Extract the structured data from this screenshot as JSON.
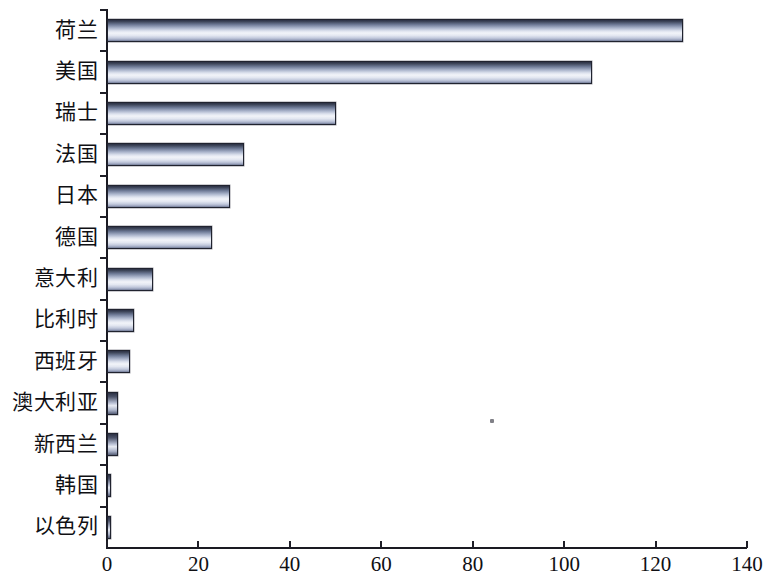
{
  "chart_data": {
    "type": "bar",
    "orientation": "horizontal",
    "title": "",
    "subtitle": "",
    "xlabel": "",
    "ylabel": "",
    "xlim": [
      0,
      140
    ],
    "xticks": [
      0,
      20,
      40,
      60,
      80,
      100,
      120,
      140
    ],
    "xtick_labels": [
      "0",
      "20",
      "40",
      "60",
      "80",
      "100",
      "120",
      "140"
    ],
    "grid": false,
    "legend": false,
    "legend_position": "none",
    "categories": [
      "荷兰",
      "美国",
      "瑞士",
      "法国",
      "日本",
      "德国",
      "意大利",
      "比利时",
      "西班牙",
      "澳大利亚",
      "新西兰",
      "韩国",
      "以色列"
    ],
    "values": [
      126,
      106,
      50,
      30,
      27,
      23,
      10,
      6,
      5,
      2.4,
      2.4,
      0.9,
      0.8
    ],
    "bar_style": {
      "fill": "vertical-gradient-steel-blue",
      "edge_color": "#20232f",
      "top_color": "#2b3044",
      "highlight_color": "#f2f4f9",
      "bottom_color": "#6d7691"
    }
  },
  "axis": {
    "axis_color": "#1a1a22",
    "tick_color": "#1f1f28"
  },
  "artifact": {
    "name": "scan-speck"
  }
}
